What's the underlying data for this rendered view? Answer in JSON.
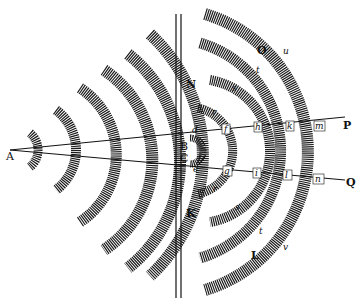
{
  "diagram": {
    "colors": {
      "ink": "#111111",
      "paper": "#ffffff"
    },
    "source": {
      "label": "A",
      "x": 14,
      "y": 150
    },
    "slits": [
      {
        "label": "B",
        "x": 180,
        "y": 145
      },
      {
        "label": "C",
        "x": 180,
        "y": 158
      }
    ],
    "barrier": {
      "label_top": "N",
      "label_bottom": "K",
      "x1": 176,
      "x2": 181
    },
    "rays": [
      {
        "label": "P",
        "from": "A",
        "to_x": 345,
        "to_y": 117
      },
      {
        "label": "Q",
        "from": "A",
        "to_x": 345,
        "to_y": 180
      }
    ],
    "region_labels": [
      {
        "label": "O",
        "x": 258,
        "y": 50
      },
      {
        "label": "L",
        "x": 251,
        "y": 255
      }
    ],
    "upper_points": [
      "d",
      "r",
      "f",
      "s",
      "h",
      "t",
      "k",
      "v",
      "m",
      "u"
    ],
    "lower_points": [
      "e",
      "r",
      "g",
      "s",
      "i",
      "t",
      "l",
      "v",
      "n"
    ],
    "labels": {
      "A": "A",
      "B": "B",
      "C": "C",
      "N": "N",
      "K": "K",
      "O": "O",
      "L": "L",
      "P": "P",
      "Q": "Q",
      "d": "d",
      "e": "e",
      "f": "f",
      "g": "g",
      "h": "h",
      "i": "i",
      "k": "k",
      "l": "l",
      "m": "m",
      "n": "n",
      "r_up": "r",
      "r_dn": "r",
      "s_up": "s",
      "s_dn": "s",
      "t_up": "t",
      "t_dn": "t",
      "v_up": "v",
      "v_dn": "v",
      "u": "u"
    }
  }
}
